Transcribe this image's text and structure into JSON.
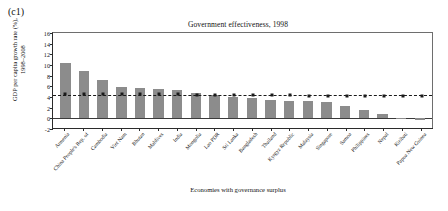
{
  "panel": {
    "tag": "(c1)"
  },
  "chart_data": {
    "type": "bar",
    "title": "Government effectiveness, 1998",
    "xlabel": "Economies with governance surplus",
    "ylabel": "GDP per capita growth rate (%), 1998–2008",
    "ylim": [
      -2,
      16
    ],
    "yticks": [
      -2,
      0,
      2,
      4,
      6,
      8,
      10,
      12,
      14,
      16
    ],
    "grid": false,
    "legend": "none",
    "bar_color": "#8c8c8c",
    "reference_color": "#1a1a1a",
    "categories": [
      "Armenia",
      "China People's Rep. of",
      "Cambodia",
      "Viet Nam",
      "Bhutan",
      "Maldives",
      "India",
      "Mongolia",
      "Lao PDR",
      "Sri Lanka",
      "Bangladesh",
      "Thailand",
      "Kyrgyz Republic",
      "Malaysia",
      "Singapore",
      "Samoa",
      "Philippines",
      "Nepal",
      "Kiribati",
      "Papua New Guinea"
    ],
    "series": [
      {
        "name": "GDP per capita growth rate",
        "type": "bar",
        "values": [
          10.4,
          8.8,
          7.2,
          5.8,
          5.7,
          5.5,
          5.4,
          4.7,
          4.3,
          4.0,
          3.8,
          3.5,
          3.3,
          3.2,
          3.1,
          2.4,
          1.5,
          0.9,
          -0.1,
          -0.4
        ]
      },
      {
        "name": "Regional average reference",
        "type": "line",
        "style": "dashed-with-square-markers",
        "values": [
          4.5,
          4.5,
          4.5,
          4.5,
          4.5,
          4.5,
          4.5,
          4.4,
          4.4,
          4.3,
          4.3,
          4.3,
          4.3,
          4.2,
          4.2,
          4.2,
          4.2,
          4.2,
          4.2,
          4.2
        ]
      }
    ]
  }
}
